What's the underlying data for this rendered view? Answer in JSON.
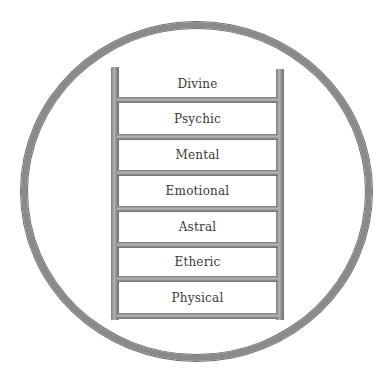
{
  "diagram": {
    "type": "ladder-in-circle",
    "levels_top_to_bottom": [
      "Divine",
      "Psychic",
      "Mental",
      "Emotional",
      "Astral",
      "Etheric",
      "Physical"
    ],
    "colors": {
      "frame": "#8a8a8a",
      "text": "#3a3a3a",
      "background": "#ffffff"
    }
  }
}
